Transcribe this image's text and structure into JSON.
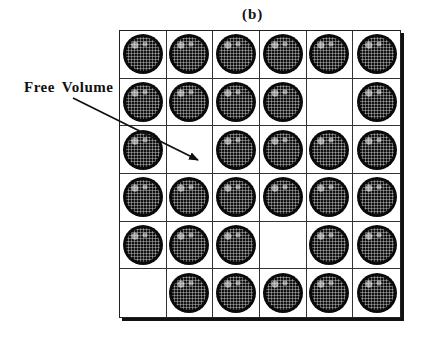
{
  "figure": {
    "panel_label": "(b)",
    "annotation": "Free Volume",
    "grid": {
      "rows": 6,
      "cols": 6,
      "occupancy": [
        [
          1,
          1,
          1,
          1,
          1,
          1
        ],
        [
          1,
          1,
          1,
          1,
          0,
          1
        ],
        [
          1,
          0,
          1,
          1,
          1,
          1
        ],
        [
          1,
          1,
          1,
          1,
          1,
          1
        ],
        [
          1,
          1,
          1,
          0,
          1,
          1
        ],
        [
          0,
          1,
          1,
          1,
          1,
          1
        ]
      ]
    },
    "arrow": {
      "from": [
        73,
        98
      ],
      "to": [
        198,
        160
      ]
    },
    "colors": {
      "particle": "#111111",
      "grid_line": "#333333",
      "background": "#ffffff"
    }
  }
}
